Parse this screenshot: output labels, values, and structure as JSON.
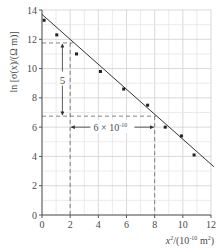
{
  "chart_data": {
    "type": "scatter",
    "title": "",
    "xlabel": "x²/(10⁻¹⁰ m²)",
    "xlabel_parts": {
      "base": "x",
      "sup1": "2",
      "mid": "/(10",
      "sup2": "-10",
      "end": " m",
      "sup3": "2",
      "close": ")"
    },
    "ylabel": "ln [σ(x)/(Ω m)]",
    "xlim": [
      0,
      12
    ],
    "ylim": [
      0,
      14
    ],
    "xticks": [
      0,
      2,
      4,
      6,
      8,
      10,
      12
    ],
    "yticks": [
      0,
      2,
      4,
      6,
      8,
      10,
      12,
      14
    ],
    "grid": true,
    "grid_minor_step_x": 1,
    "grid_minor_step_y": 1,
    "legend": null,
    "series": [
      {
        "name": "data points",
        "points": [
          {
            "x": 0.15,
            "y": 13.3
          },
          {
            "x": 1.05,
            "y": 12.3
          },
          {
            "x": 2.45,
            "y": 11.0
          },
          {
            "x": 4.15,
            "y": 9.8
          },
          {
            "x": 5.8,
            "y": 8.6
          },
          {
            "x": 7.5,
            "y": 7.5
          },
          {
            "x": 8.75,
            "y": 6.0
          },
          {
            "x": 9.9,
            "y": 5.4
          },
          {
            "x": 10.8,
            "y": 4.1
          }
        ]
      }
    ],
    "fit_line": {
      "x0": 0,
      "y0": 13.7,
      "x1": 12.2,
      "y1": 3.3
    },
    "annotations": {
      "rise_label": "5",
      "run_label": "6 × 10",
      "run_label_sup": "-10",
      "rise": {
        "x": 1.45,
        "y_top": 11.75,
        "y_bottom": 6.75
      },
      "run": {
        "y": 6.0,
        "x_left": 2,
        "x_right": 8
      },
      "guide_h_top": {
        "y": 11.75,
        "x_from": 0,
        "x_to": 2.2
      },
      "guide_h_bottom": {
        "y": 6.75,
        "x_from": 0,
        "x_to": 8.1
      },
      "guide_v_left": {
        "x": 2,
        "y_from": 11.75,
        "y_to": 0
      },
      "guide_v_right": {
        "x": 8,
        "y_from": 6.75,
        "y_to": 0
      }
    },
    "colors": {
      "axis": "#555555",
      "grid_major": "#cfcfcf",
      "grid_minor": "#e6e6e6",
      "points": "#222222",
      "line": "#333333",
      "dash": "#666666"
    }
  }
}
